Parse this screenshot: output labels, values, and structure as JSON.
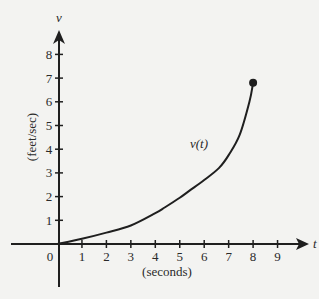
{
  "chart_data": {
    "type": "line",
    "title": "",
    "xlabel": "(seconds)",
    "ylabel": "(feet/sec)",
    "x_axis_letter": "t",
    "y_axis_letter": "v",
    "curve_label": "v(t)",
    "xlim": [
      0,
      9
    ],
    "ylim": [
      0,
      8
    ],
    "x_ticks": [
      "0",
      "1",
      "2",
      "3",
      "4",
      "5",
      "6",
      "7",
      "8",
      "9"
    ],
    "y_ticks": [
      "1",
      "2",
      "3",
      "4",
      "5",
      "6",
      "7",
      "8"
    ],
    "grid": false,
    "legend": null,
    "series": [
      {
        "name": "v(t)",
        "x": [
          0,
          1,
          2,
          3,
          4,
          4.4,
          5,
          5.4,
          6,
          6.6,
          7,
          7.45,
          7.85,
          8
        ],
        "values": [
          0,
          0.22,
          0.48,
          0.78,
          1.3,
          1.55,
          1.95,
          2.25,
          2.7,
          3.2,
          3.75,
          4.6,
          6.0,
          6.8
        ]
      }
    ],
    "annotations": [
      {
        "type": "endpoint-dot",
        "x": 8,
        "y": 6.8
      }
    ]
  },
  "colors": {
    "ink": "#1f1f1f",
    "paper": "#f3f3f1"
  }
}
